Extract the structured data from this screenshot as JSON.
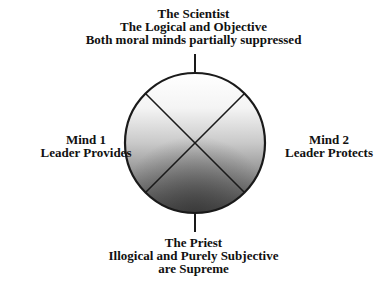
{
  "diagram": {
    "top": {
      "lines": [
        "The Scientist",
        "The Logical and Objective",
        "Both moral minds partially suppressed"
      ]
    },
    "left": {
      "lines": [
        "Mind 1",
        "Leader Provides"
      ]
    },
    "right": {
      "lines": [
        "Mind 2",
        "Leader Protects"
      ]
    },
    "bottom": {
      "lines": [
        "The Priest",
        "Illogical and Purely Subjective",
        "are Supreme"
      ]
    },
    "colors": {
      "stroke": "#1a1a1a",
      "gradient_top": "#ffffff",
      "gradient_bottom": "#4a4a4a",
      "text": "#111111"
    }
  }
}
